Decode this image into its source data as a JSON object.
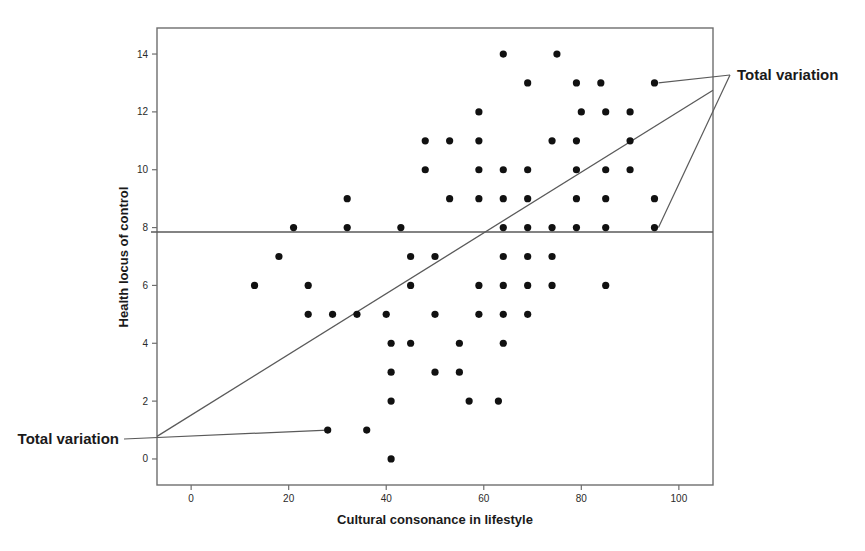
{
  "chart_data": {
    "type": "scatter",
    "title": "",
    "xlabel": "Cultural consonance in lifestyle",
    "ylabel": "Health locus of control",
    "xlim": [
      -7,
      107
    ],
    "ylim": [
      -0.9,
      14.9
    ],
    "xticks": [
      0,
      20,
      40,
      60,
      80,
      100
    ],
    "yticks": [
      0,
      2,
      4,
      6,
      8,
      10,
      12,
      14
    ],
    "grid": false,
    "legend": null,
    "points": [
      {
        "x": 64,
        "y": 14
      },
      {
        "x": 75,
        "y": 14
      },
      {
        "x": 69,
        "y": 13
      },
      {
        "x": 79,
        "y": 13
      },
      {
        "x": 84,
        "y": 13
      },
      {
        "x": 95,
        "y": 13
      },
      {
        "x": 59,
        "y": 12
      },
      {
        "x": 80,
        "y": 12
      },
      {
        "x": 85,
        "y": 12
      },
      {
        "x": 90,
        "y": 12
      },
      {
        "x": 48,
        "y": 11
      },
      {
        "x": 53,
        "y": 11
      },
      {
        "x": 59,
        "y": 11
      },
      {
        "x": 74,
        "y": 11
      },
      {
        "x": 79,
        "y": 11
      },
      {
        "x": 90,
        "y": 11
      },
      {
        "x": 48,
        "y": 10
      },
      {
        "x": 59,
        "y": 10
      },
      {
        "x": 64,
        "y": 10
      },
      {
        "x": 69,
        "y": 10
      },
      {
        "x": 79,
        "y": 10
      },
      {
        "x": 85,
        "y": 10
      },
      {
        "x": 90,
        "y": 10
      },
      {
        "x": 32,
        "y": 9
      },
      {
        "x": 53,
        "y": 9
      },
      {
        "x": 59,
        "y": 9
      },
      {
        "x": 64,
        "y": 9
      },
      {
        "x": 69,
        "y": 9
      },
      {
        "x": 79,
        "y": 9
      },
      {
        "x": 85,
        "y": 9
      },
      {
        "x": 95,
        "y": 9
      },
      {
        "x": 21,
        "y": 8
      },
      {
        "x": 32,
        "y": 8
      },
      {
        "x": 43,
        "y": 8
      },
      {
        "x": 64,
        "y": 8
      },
      {
        "x": 69,
        "y": 8
      },
      {
        "x": 74,
        "y": 8
      },
      {
        "x": 79,
        "y": 8
      },
      {
        "x": 85,
        "y": 8
      },
      {
        "x": 95,
        "y": 8
      },
      {
        "x": 18,
        "y": 7
      },
      {
        "x": 45,
        "y": 7
      },
      {
        "x": 50,
        "y": 7
      },
      {
        "x": 64,
        "y": 7
      },
      {
        "x": 69,
        "y": 7
      },
      {
        "x": 74,
        "y": 7
      },
      {
        "x": 13,
        "y": 6
      },
      {
        "x": 24,
        "y": 6
      },
      {
        "x": 45,
        "y": 6
      },
      {
        "x": 59,
        "y": 6
      },
      {
        "x": 64,
        "y": 6
      },
      {
        "x": 69,
        "y": 6
      },
      {
        "x": 74,
        "y": 6
      },
      {
        "x": 85,
        "y": 6
      },
      {
        "x": 24,
        "y": 5
      },
      {
        "x": 29,
        "y": 5
      },
      {
        "x": 34,
        "y": 5
      },
      {
        "x": 40,
        "y": 5
      },
      {
        "x": 50,
        "y": 5
      },
      {
        "x": 59,
        "y": 5
      },
      {
        "x": 64,
        "y": 5
      },
      {
        "x": 69,
        "y": 5
      },
      {
        "x": 41,
        "y": 4
      },
      {
        "x": 45,
        "y": 4
      },
      {
        "x": 55,
        "y": 4
      },
      {
        "x": 64,
        "y": 4
      },
      {
        "x": 41,
        "y": 3
      },
      {
        "x": 50,
        "y": 3
      },
      {
        "x": 55,
        "y": 3
      },
      {
        "x": 41,
        "y": 2
      },
      {
        "x": 57,
        "y": 2
      },
      {
        "x": 63,
        "y": 2
      },
      {
        "x": 28,
        "y": 1
      },
      {
        "x": 36,
        "y": 1
      },
      {
        "x": 41,
        "y": 0
      }
    ],
    "mean_line": {
      "label": "mean of y",
      "y": 7.85
    },
    "regression_line": {
      "x1": -7,
      "y1": 0.78,
      "x2": 107,
      "y2": 12.75
    },
    "annotations": [
      {
        "text": "Total variation",
        "position": "top-right"
      },
      {
        "text": "Total variation",
        "position": "bottom-left"
      }
    ]
  },
  "axes": {
    "x_title": "Cultural consonance in lifestyle",
    "y_title": "Health locus of control",
    "x_tick_labels": [
      "0",
      "20",
      "40",
      "60",
      "80",
      "100"
    ],
    "y_tick_labels": [
      "0",
      "2",
      "4",
      "6",
      "8",
      "10",
      "12",
      "14"
    ]
  },
  "annotations": {
    "top_right_label": "Total variation",
    "bottom_left_label": "Total variation"
  },
  "colors": {
    "point": "#111111",
    "line": "#555555",
    "frame": "#6e6e6e",
    "text": "#1a1a1a",
    "background": "#ffffff"
  }
}
